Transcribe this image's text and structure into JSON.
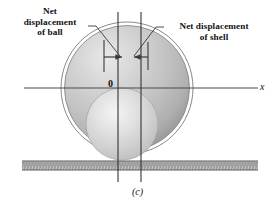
{
  "figure": {
    "caption": "(c)",
    "origin_label": "0",
    "axis_label_x": "x",
    "annotations": {
      "ball": {
        "line1": "Net",
        "line2": "displacement",
        "line3": "of ball"
      },
      "shell": {
        "line1": "Net displacement",
        "line2": "of shell"
      }
    },
    "colors": {
      "background": "#ffffff",
      "shell_fill": "#c4c4c4",
      "shell_highlight": "#e6e6e6",
      "shell_shadow": "#9a9a9a",
      "shell_outline": "#6e6e6e",
      "ball_fill": "#d6d6d6",
      "ball_highlight": "#f2f2f2",
      "ball_outline": "#a8a8a8",
      "ground_fill": "#b9b9b9",
      "ground_border": "#6e6e6e",
      "axis_line": "#4a4a4a",
      "arrow": "#3a3a3a",
      "leader_line": "#3a3a3a",
      "text": "#111111"
    },
    "geometry": {
      "shell_center_x": 127,
      "shell_center_y": 88,
      "shell_radius_outer": 66,
      "shell_radius_inner": 62,
      "ball_center_x": 122,
      "ball_center_y": 124,
      "ball_radius": 36,
      "axis_y": 88,
      "axis_x_start": 24,
      "axis_x_end": 258,
      "vline_left_x": 118,
      "vline_right_x": 141,
      "vline_top_y": 12,
      "vline_bottom_y": 182,
      "ground_top_y": 161,
      "ground_bottom_y": 170,
      "ground_x_start": 22,
      "ground_x_end": 258,
      "arrow_y": 57,
      "arrow_left_tail_x": 104,
      "arrow_left_head_x": 124,
      "arrow_right_tail_x": 148,
      "arrow_right_head_x": 133,
      "tick_left_x": 104,
      "tick_right_x": 148,
      "tick_top_y": 40,
      "tick_bottom_y": 72
    }
  }
}
